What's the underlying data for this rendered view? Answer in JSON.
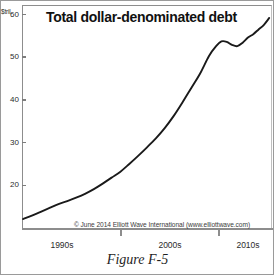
{
  "figure": {
    "caption": "Figure F-5",
    "copyright": "© June 2014 Elliott Wave International (www.elliottwave.com)"
  },
  "chart_data": {
    "type": "line",
    "title": "Total dollar-denominated debt",
    "xlabel": "",
    "ylabel": "$tril.",
    "ylim": [
      10,
      62
    ],
    "xlim": [
      1986,
      2014
    ],
    "grid": false,
    "legend": null,
    "yticks": [
      60,
      50,
      40,
      30,
      20
    ],
    "ytick_labels": [
      "60",
      "50",
      "40",
      "30",
      "20"
    ],
    "xticks": [
      1990,
      2000,
      2010
    ],
    "xtick_labels": [
      "1990s",
      "2000s",
      "2010s"
    ],
    "line_color": "#1a1a1a",
    "x": [
      1986.0,
      1987.0,
      1988.0,
      1989.0,
      1990.0,
      1991.0,
      1992.0,
      1993.0,
      1994.0,
      1995.0,
      1996.0,
      1997.0,
      1998.0,
      1999.0,
      2000.0,
      2001.0,
      2002.0,
      2003.0,
      2004.0,
      2005.0,
      2006.0,
      2007.0,
      2007.8,
      2008.4,
      2009.0,
      2009.6,
      2010.2,
      2010.8,
      2011.4,
      2012.0,
      2012.6,
      2013.2,
      2013.8
    ],
    "values": [
      12.1,
      12.9,
      13.8,
      14.7,
      15.6,
      16.3,
      17.1,
      18.0,
      19.1,
      20.4,
      21.8,
      23.2,
      25.0,
      26.9,
      28.9,
      31.0,
      33.4,
      36.2,
      39.4,
      42.8,
      46.2,
      50.3,
      52.6,
      53.7,
      53.6,
      52.9,
      52.6,
      53.4,
      54.6,
      55.4,
      56.5,
      57.6,
      59.2
    ],
    "series": [
      {
        "name": "Total dollar-denominated debt",
        "values": [
          12.1,
          12.9,
          13.8,
          14.7,
          15.6,
          16.3,
          17.1,
          18.0,
          19.1,
          20.4,
          21.8,
          23.2,
          25.0,
          26.9,
          28.9,
          31.0,
          33.4,
          36.2,
          39.4,
          42.8,
          46.2,
          50.3,
          52.6,
          53.7,
          53.6,
          52.9,
          52.6,
          53.4,
          54.6,
          55.4,
          56.5,
          57.6,
          59.2
        ]
      }
    ],
    "annotations": [
      "© June 2014 Elliott Wave International (www.elliottwave.com)"
    ]
  }
}
